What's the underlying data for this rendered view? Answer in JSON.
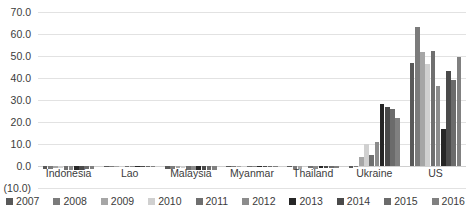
{
  "chart_data": {
    "type": "bar",
    "title": "",
    "xlabel": "",
    "ylabel": "",
    "ylim": [
      -10,
      70
    ],
    "ytick_labels": [
      "70.0",
      "60.0",
      "50.0",
      "40.0",
      "30.0",
      "20.0",
      "10.0",
      "0.0",
      "(10.0)"
    ],
    "ytick_values": [
      70,
      60,
      50,
      40,
      30,
      20,
      10,
      0,
      -10
    ],
    "grid": true,
    "legend_position": "bottom",
    "categories": [
      "Indonesia",
      "Lao",
      "Malaysia",
      "Myanmar",
      "Thailand",
      "Ukraine",
      "US"
    ],
    "series": [
      {
        "name": "2007",
        "color": "#595959",
        "values": [
          -1.5,
          0.0,
          -1.5,
          0.0,
          0.0,
          -1.0,
          47.0
        ]
      },
      {
        "name": "2008",
        "color": "#7b7b7b",
        "values": [
          -1.4,
          0.0,
          -1.4,
          0.0,
          -1.2,
          0.0,
          63.0
        ]
      },
      {
        "name": "2009",
        "color": "#a6a6a6",
        "values": [
          -1.0,
          -0.4,
          -1.0,
          0.0,
          -1.2,
          4.0,
          52.0
        ]
      },
      {
        "name": "2010",
        "color": "#d0d0d0",
        "values": [
          -0.8,
          -0.4,
          -0.8,
          0.0,
          0.0,
          10.0,
          46.5
        ]
      },
      {
        "name": "2011",
        "color": "#6f6f6f",
        "values": [
          -1.6,
          -0.4,
          -1.6,
          0.0,
          -1.0,
          5.0,
          52.5
        ]
      },
      {
        "name": "2012",
        "color": "#8c8c8c",
        "values": [
          -1.6,
          -0.4,
          -1.6,
          0.0,
          -1.3,
          11.0,
          36.5
        ]
      },
      {
        "name": "2013",
        "color": "#262626",
        "values": [
          -1.7,
          -0.4,
          -1.7,
          0.0,
          -1.0,
          28.0,
          17.0
        ]
      },
      {
        "name": "2014",
        "color": "#4a4a4a",
        "values": [
          -1.7,
          -0.3,
          -1.7,
          0.0,
          -1.1,
          27.0,
          43.0
        ]
      },
      {
        "name": "2015",
        "color": "#6b6b6b",
        "values": [
          -1.3,
          -0.3,
          -1.7,
          0.0,
          -0.8,
          26.0,
          39.0
        ]
      },
      {
        "name": "2016",
        "color": "#808080",
        "values": [
          -1.5,
          -0.3,
          -1.7,
          0.0,
          -1.1,
          22.0,
          49.5
        ]
      }
    ]
  }
}
